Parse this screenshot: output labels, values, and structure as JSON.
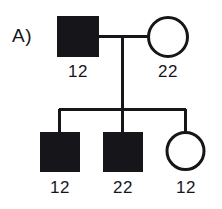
{
  "figure": {
    "panel_label": "A)",
    "type": "pedigree-chart"
  },
  "colors": {
    "stroke": "#16161a",
    "affected_fill": "#16161a",
    "unaffected_fill": "#ffffff",
    "background": "#ffffff",
    "text": "#16161a"
  },
  "generations": [
    {
      "name": "generation-1",
      "individuals": [
        {
          "id": "father",
          "sex": "male",
          "shape": "square",
          "affected": true,
          "genotype": "12"
        },
        {
          "id": "mother",
          "sex": "female",
          "shape": "circle",
          "affected": false,
          "genotype": "22"
        }
      ]
    },
    {
      "name": "generation-2",
      "individuals": [
        {
          "id": "child-1",
          "sex": "male",
          "shape": "square",
          "affected": true,
          "genotype": "12"
        },
        {
          "id": "child-2",
          "sex": "male",
          "shape": "square",
          "affected": true,
          "genotype": "22"
        },
        {
          "id": "child-3",
          "sex": "female",
          "shape": "circle",
          "affected": false,
          "genotype": "12"
        }
      ]
    }
  ]
}
